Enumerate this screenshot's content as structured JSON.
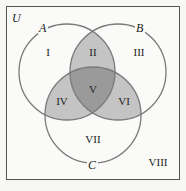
{
  "diagram": {
    "type": "venn",
    "universe_label": "U",
    "sets": [
      {
        "name": "A",
        "cx": 67,
        "cy": 72,
        "r": 48
      },
      {
        "name": "B",
        "cx": 118,
        "cy": 72,
        "r": 48
      },
      {
        "name": "C",
        "cx": 93,
        "cy": 115,
        "r": 48
      }
    ],
    "regions": [
      {
        "label": "I",
        "description": "A only"
      },
      {
        "label": "II",
        "description": "A and B only"
      },
      {
        "label": "III",
        "description": "B only"
      },
      {
        "label": "IV",
        "description": "A and C only"
      },
      {
        "label": "V",
        "description": "A, B and C"
      },
      {
        "label": "VI",
        "description": "B and C only"
      },
      {
        "label": "VII",
        "description": "C only"
      },
      {
        "label": "VIII",
        "description": "outside A, B, C"
      }
    ],
    "colors": {
      "background": "#f7f7f5",
      "stroke": "#7a7a7a",
      "shade_two": "#c4c4c4",
      "shade_three": "#9a9a9a"
    }
  }
}
